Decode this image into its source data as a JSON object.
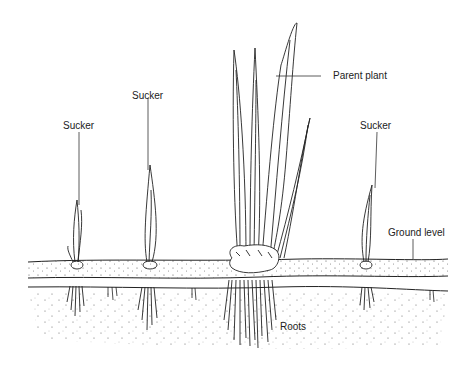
{
  "diagram": {
    "title": "",
    "labels": {
      "parent_plant": "Parent plant",
      "sucker_left": "Sucker",
      "sucker_mid": "Sucker",
      "sucker_right": "Sucker",
      "ground_level": "Ground level",
      "roots": "Roots"
    },
    "colors": {
      "line": "#222222",
      "background": "#ffffff"
    }
  }
}
